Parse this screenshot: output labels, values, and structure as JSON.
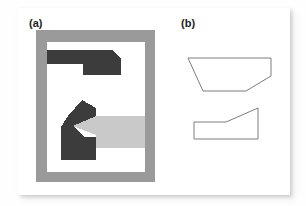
{
  "figure": {
    "panels": [
      {
        "id": "a",
        "label": "(a)",
        "description": "segmented region image with gray frame"
      },
      {
        "id": "b",
        "label": "(b)",
        "description": "extracted polygon outlines"
      }
    ]
  },
  "colors": {
    "page_background": "#fefefe",
    "card_background": "#ffffff",
    "frame_gray": "#9a9a9a",
    "inner_white": "#ffffff",
    "region_dark": "#3c3c3c",
    "region_light_gray": "#c9c9c9",
    "outline_stroke": "#7d7d7d",
    "label_text": "#1d1d1d"
  },
  "panel_a": {
    "frame": {
      "x": 0,
      "y": 0,
      "width": 119,
      "height": 152,
      "fill": "#9a9a9a"
    },
    "inner": {
      "x": 11,
      "y": 12,
      "width": 98,
      "height": 130,
      "fill": "#ffffff"
    },
    "shapes": [
      {
        "name": "top-dark-region",
        "fill": "#3c3c3c",
        "points": "11,20 76,20 85,28 85,45 47,45 47,34 11,34"
      },
      {
        "name": "lower-dark-region",
        "fill": "#3c3c3c",
        "points": "32,86 46,70 60,78 60,86 37,96 47,107 60,107 60,130 25,130 25,97"
      },
      {
        "name": "light-gray-wedge",
        "fill": "#c9c9c9",
        "points": "60,86 109,86 109,104 98,111 60,104 37,96"
      },
      {
        "name": "right-light-gray-band",
        "fill": "#c9c9c9",
        "points": "98,111 109,104 109,118 60,118 60,107"
      }
    ]
  },
  "panel_b": {
    "outlines": [
      {
        "name": "upper-trapezoid-outline",
        "stroke": "#7d7d7d",
        "fill": "#ffffff",
        "points": "2,16 85,16 85,34 60,49 17,49"
      },
      {
        "name": "lower-notched-outline",
        "stroke": "#7d7d7d",
        "fill": "#ffffff",
        "points": "8,80 40,80 72,66 72,97 8,97"
      }
    ]
  }
}
